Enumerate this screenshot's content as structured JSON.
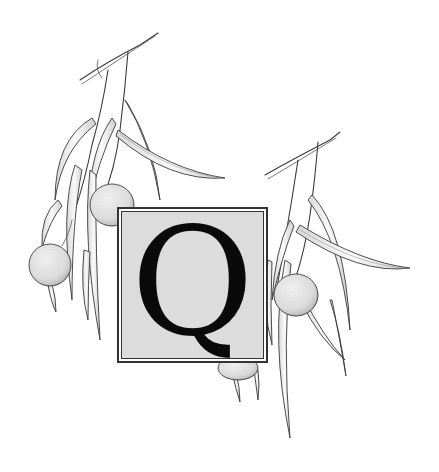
{
  "dropcap": {
    "letter": "Q",
    "box_fill": "#dcdcdc",
    "border_color": "#333333",
    "letter_color": "#0a0a0a"
  },
  "illustration": {
    "subject": "botanical pen-and-ink drawing of branches with narrow hanging leaves and round fruits",
    "ink_color": "#3a3a3a",
    "fruit_count": 4,
    "branch_count": 2
  }
}
